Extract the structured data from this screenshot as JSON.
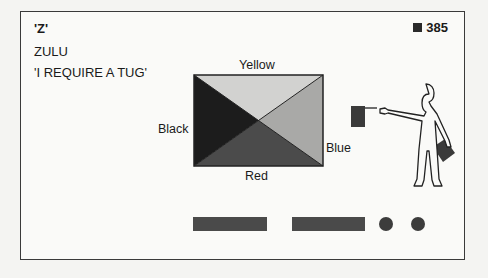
{
  "card": {
    "letter": "'Z'",
    "phonetic_word": "ZULU",
    "meaning": "'I REQUIRE A TUG'",
    "page_number": "385"
  },
  "flag": {
    "labels": {
      "top": "Yellow",
      "left": "Black",
      "right": "Blue",
      "bottom": "Red"
    },
    "colors": {
      "top": "#cfcfcf",
      "left": "#1c1c1c",
      "right": "#a8a8a8",
      "bottom": "#4a4a4a"
    }
  },
  "semaphore": {
    "figure": "person-with-two-flags"
  },
  "morse": {
    "code": "— — • •",
    "symbols": [
      "dash",
      "dash",
      "dot",
      "dot"
    ]
  }
}
